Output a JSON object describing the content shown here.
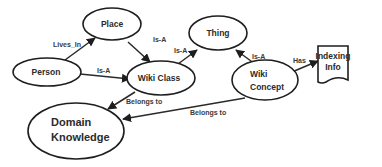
{
  "diagram": {
    "nodes": [
      {
        "id": "place",
        "label": "Place",
        "shape": "ellipse"
      },
      {
        "id": "person",
        "label": "Person",
        "shape": "ellipse"
      },
      {
        "id": "wiki_class",
        "label": "Wiki Class",
        "shape": "ellipse"
      },
      {
        "id": "thing",
        "label": "Thing",
        "shape": "ellipse"
      },
      {
        "id": "wiki_concept",
        "label_lines": [
          "Wiki",
          "Concept"
        ],
        "shape": "ellipse"
      },
      {
        "id": "indexing_info",
        "label_lines": [
          "Indexing",
          "Info"
        ],
        "shape": "document"
      },
      {
        "id": "domain_knowledge",
        "label_lines": [
          "Domain",
          "Knowledge"
        ],
        "shape": "ellipse"
      }
    ],
    "edges": [
      {
        "from": "person",
        "to": "place",
        "label": "Lives_In"
      },
      {
        "from": "person",
        "to": "wiki_class",
        "label": "Is-A"
      },
      {
        "from": "place",
        "to": "wiki_class",
        "label": "Is-A"
      },
      {
        "from": "wiki_class",
        "to": "thing",
        "label": "Is-A"
      },
      {
        "from": "wiki_concept",
        "to": "thing",
        "label": "Is-A"
      },
      {
        "from": "wiki_concept",
        "to": "indexing_info",
        "label": "Has"
      },
      {
        "from": "wiki_class",
        "to": "domain_knowledge",
        "label": "Belongs to"
      },
      {
        "from": "wiki_concept",
        "to": "domain_knowledge",
        "label": "Belongs to"
      }
    ]
  }
}
